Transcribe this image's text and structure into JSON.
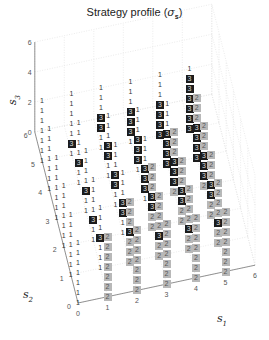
{
  "chart_data": {
    "type": "scatter3d-text",
    "title_main": "Strategy profile (",
    "title_symbol": "σ",
    "title_sub": "s",
    "title_end": ")",
    "xlabel": "s1",
    "ylabel": "s2",
    "zlabel": "s3",
    "x_ticks": [
      "0",
      "1",
      "2",
      "3",
      "4",
      "5",
      "6"
    ],
    "y_ticks": [
      "0",
      "1",
      "2",
      "3",
      "4",
      "5",
      "6"
    ],
    "z_ticks": [
      "0",
      "2",
      "4",
      "6"
    ],
    "xlim": [
      0,
      6
    ],
    "ylim": [
      0,
      6
    ],
    "zlim": [
      0,
      6
    ],
    "legend": {
      "1": "plain text label",
      "2": "light gray box",
      "3": "dark box"
    },
    "colors": {
      "label_1": "#333333",
      "box_2": "#b8b8b8",
      "box_3": "#1c1c1c"
    },
    "columns": [
      {
        "s1": 0,
        "s2": 0,
        "labels": "1111111"
      },
      {
        "s1": 0,
        "s2": 1,
        "labels": "1111111"
      },
      {
        "s1": 0,
        "s2": 2,
        "labels": "1111111"
      },
      {
        "s1": 0,
        "s2": 3,
        "labels": "1111111"
      },
      {
        "s1": 0,
        "s2": 4,
        "labels": "1111111"
      },
      {
        "s1": 0,
        "s2": 5,
        "labels": "1111111"
      },
      {
        "s1": 1,
        "s2": 0,
        "labels": "2222222"
      },
      {
        "s1": 1,
        "s2": 1,
        "labels": "1113111"
      },
      {
        "s1": 1,
        "s2": 2,
        "labels": "1131111"
      },
      {
        "s1": 1,
        "s2": 3,
        "labels": "1131111"
      },
      {
        "s1": 1,
        "s2": 4,
        "labels": "1131111"
      },
      {
        "s1": 1,
        "s2": 5,
        "labels": "1311111"
      },
      {
        "s1": 2,
        "s2": 0,
        "labels": "2222222"
      },
      {
        "s1": 2,
        "s2": 1,
        "labels": "2223222"
      },
      {
        "s1": 2,
        "s2": 2,
        "labels": "1133111"
      },
      {
        "s1": 2,
        "s2": 3,
        "labels": "1133111"
      },
      {
        "s1": 2,
        "s2": 4,
        "labels": "1133111"
      },
      {
        "s1": 2,
        "s2": 5,
        "labels": "1133111"
      },
      {
        "s1": 3,
        "s2": 0,
        "labels": "2222222"
      },
      {
        "s1": 3,
        "s2": 1,
        "labels": "2232222"
      },
      {
        "s1": 3,
        "s2": 2,
        "labels": "2233222"
      },
      {
        "s1": 3,
        "s2": 3,
        "labels": "1333111"
      },
      {
        "s1": 3,
        "s2": 4,
        "labels": "1333111"
      },
      {
        "s1": 3,
        "s2": 5,
        "labels": "1333111"
      },
      {
        "s1": 4,
        "s2": 0,
        "labels": "2222222"
      },
      {
        "s1": 4,
        "s2": 1,
        "labels": "2232222"
      },
      {
        "s1": 4,
        "s2": 2,
        "labels": "2233222"
      },
      {
        "s1": 4,
        "s2": 3,
        "labels": "2333222"
      },
      {
        "s1": 4,
        "s2": 4,
        "labels": "3333111"
      },
      {
        "s1": 4,
        "s2": 5,
        "labels": "3333111"
      },
      {
        "s1": 5,
        "s2": 0,
        "labels": "2222222"
      },
      {
        "s1": 5,
        "s2": 1,
        "labels": "2232222"
      },
      {
        "s1": 5,
        "s2": 2,
        "labels": "2233222"
      },
      {
        "s1": 5,
        "s2": 3,
        "labels": "2333222"
      },
      {
        "s1": 5,
        "s2": 4,
        "labels": "3333222"
      },
      {
        "s1": 5,
        "s2": 5,
        "labels": "3333331"
      }
    ]
  },
  "projection": {
    "origin": [
      78,
      303
    ],
    "s1_step": [
      29.5,
      -6.3
    ],
    "s2_step": [
      -7.2,
      -28.5
    ],
    "s3_step": [
      0,
      -10
    ]
  }
}
